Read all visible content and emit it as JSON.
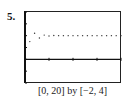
{
  "problem_number": "5.",
  "caption": "[0, 20] by [−2, 4]",
  "chart_data": {
    "type": "scatter",
    "title": "",
    "xlabel": "",
    "ylabel": "",
    "xlim": [
      0,
      20
    ],
    "ylim": [
      -2,
      4
    ],
    "x": [
      1,
      2,
      3,
      4,
      5,
      6,
      7,
      8,
      9,
      10,
      11,
      12,
      13,
      14,
      15,
      16,
      17,
      18,
      19,
      20
    ],
    "values": [
      1.5,
      2.2,
      1.8,
      2.05,
      1.97,
      2.01,
      2.0,
      2.0,
      2.0,
      2.0,
      2.0,
      2.0,
      2.0,
      2.0,
      2.0,
      2.0,
      2.0,
      2.0,
      2.0,
      2.0
    ],
    "grid": false,
    "x_ticks": [
      5,
      10,
      15,
      20
    ],
    "y_ticks": [
      -2,
      -1,
      0,
      1,
      2,
      3,
      4
    ]
  }
}
